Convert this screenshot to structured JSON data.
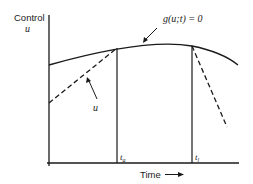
{
  "axes": {
    "y_label_line1": "Control",
    "y_label_line2": "u",
    "x_label": "Time",
    "x_arrow": "→"
  },
  "annotations": {
    "constraint": "g(u;t) = 0",
    "control_curve": "u",
    "t_a": "a",
    "t_l": "l",
    "t_symbol": "t"
  },
  "colors": {
    "ink": "#1a1a1a",
    "background": "#ffffff"
  }
}
